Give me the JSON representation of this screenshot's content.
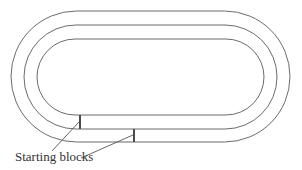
{
  "diagram": {
    "type": "running-track",
    "lanes": 2,
    "track_lines": [
      {
        "name": "outer",
        "left": 11,
        "right": 290,
        "top": 11,
        "bottom": 142
      },
      {
        "name": "middle",
        "left": 24,
        "right": 277,
        "top": 25,
        "bottom": 129
      },
      {
        "name": "inner",
        "left": 37,
        "right": 264,
        "top": 39,
        "bottom": 115
      }
    ],
    "starting_blocks": [
      {
        "lane": 1,
        "x": 80,
        "y1": 115,
        "y2": 129
      },
      {
        "lane": 2,
        "x": 134,
        "y1": 129,
        "y2": 142
      }
    ],
    "label": {
      "text": "Starting blocks"
    },
    "colors": {
      "line": "#6b6b6b",
      "block": "#4a4a4a",
      "text": "#333333",
      "background": "#ffffff"
    }
  }
}
